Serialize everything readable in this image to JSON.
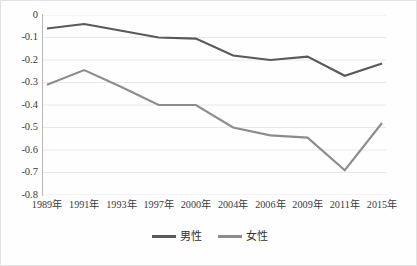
{
  "chart_data": {
    "type": "line",
    "title": "",
    "xlabel": "",
    "ylabel": "",
    "categories": [
      "1989年",
      "1991年",
      "1993年",
      "1997年",
      "2000年",
      "2004年",
      "2006年",
      "2009年",
      "2011年",
      "2015年"
    ],
    "series": [
      {
        "name": "男性",
        "color": "#595959",
        "values": [
          -0.06,
          -0.04,
          -0.07,
          -0.1,
          -0.105,
          -0.18,
          -0.2,
          -0.185,
          -0.27,
          -0.215
        ]
      },
      {
        "name": "女性",
        "color": "#8c8c8c",
        "values": [
          -0.31,
          -0.245,
          -0.32,
          -0.4,
          -0.4,
          -0.5,
          -0.535,
          -0.545,
          -0.69,
          -0.48
        ]
      }
    ],
    "ylim": [
      -0.8,
      0
    ],
    "yticks": [
      0,
      -0.1,
      -0.2,
      -0.3,
      -0.4,
      -0.5,
      -0.6,
      -0.7,
      -0.8
    ],
    "ytick_labels": [
      "0",
      "-0.1",
      "-0.2",
      "-0.3",
      "-0.4",
      "-0.5",
      "-0.6",
      "-0.7",
      "-0.8"
    ],
    "grid": true,
    "grid_color": "#e8e8e8",
    "legend_position": "bottom"
  },
  "legend": {
    "items": [
      {
        "label": "男性",
        "color": "#595959"
      },
      {
        "label": "女性",
        "color": "#8c8c8c"
      }
    ]
  }
}
